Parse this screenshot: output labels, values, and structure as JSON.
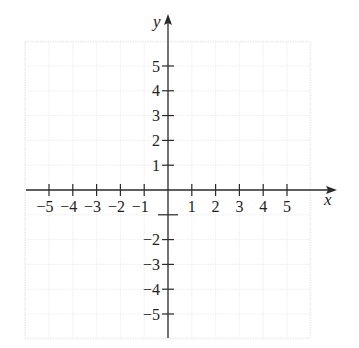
{
  "chart_data": {
    "type": "scatter",
    "title": "",
    "xlabel": "x",
    "ylabel": "y",
    "xlim": [
      -6,
      6
    ],
    "ylim": [
      -6,
      6
    ],
    "grid": true,
    "x_ticks": [
      -5,
      -4,
      -3,
      -2,
      -1,
      1,
      2,
      3,
      4,
      5
    ],
    "x_tick_labels": [
      "−5",
      "−4",
      "−3",
      "−2",
      "−1",
      "1",
      "2",
      "3",
      "4",
      "5"
    ],
    "y_ticks": [
      5,
      4,
      3,
      2,
      1,
      -1,
      -2,
      -3,
      -4,
      -5
    ],
    "y_tick_labels": [
      "5",
      "4",
      "3",
      "2",
      "1",
      "",
      "−2",
      "−3",
      "−4",
      "−5"
    ],
    "series": []
  },
  "axes": {
    "x_name": "x",
    "y_name": "y"
  },
  "colors": {
    "axis": "#2a2a2a",
    "grid": "#e8e8e8",
    "text": "#222222"
  }
}
